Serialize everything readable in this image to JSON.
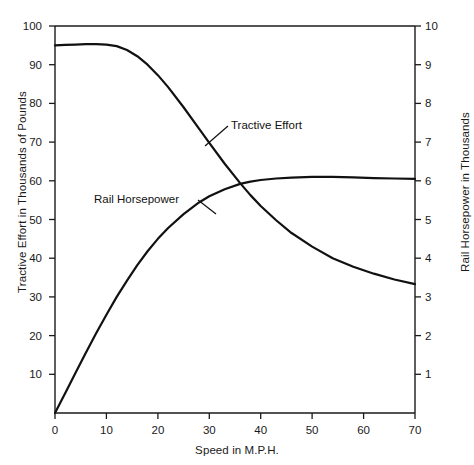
{
  "chart_data": {
    "type": "line",
    "title": "",
    "xlabel": "Speed in M.P.H.",
    "ylabel": "Tractive Effort in Thousands of Pounds",
    "ylabel_right": "Rail Horsepower in Thousands",
    "xlim": [
      0,
      70
    ],
    "ylim": [
      0,
      100
    ],
    "ylim_right": [
      0,
      10
    ],
    "xticks": [
      0,
      10,
      20,
      30,
      40,
      50,
      60,
      70
    ],
    "xtick_labels": [
      "0",
      "10",
      "20",
      "30",
      "40",
      "50",
      "60",
      "70"
    ],
    "yticks": [
      10,
      20,
      30,
      40,
      50,
      60,
      70,
      80,
      90,
      100
    ],
    "ytick_labels": [
      "10",
      "20",
      "30",
      "40",
      "50",
      "60",
      "70",
      "80",
      "90",
      "100"
    ],
    "yticks_right": [
      1,
      2,
      3,
      4,
      5,
      6,
      7,
      8,
      9,
      10
    ],
    "ytick_labels_right": [
      "1",
      "2",
      "3",
      "4",
      "5",
      "6",
      "7",
      "8",
      "9",
      "10"
    ],
    "grid": false,
    "legend_position": "inline-annotations",
    "series": [
      {
        "name": "Tractive Effort",
        "axis": "left",
        "units": "thousands of pounds",
        "x": [
          0,
          2,
          4,
          6,
          8,
          10,
          12,
          14,
          16,
          18,
          20,
          22,
          25,
          28,
          30,
          33,
          36,
          38,
          40,
          43,
          46,
          50,
          54,
          58,
          62,
          66,
          70
        ],
        "values": [
          95,
          95.1,
          95.2,
          95.3,
          95.3,
          95.2,
          94.8,
          93.8,
          92.2,
          90.0,
          87.3,
          84.2,
          79.0,
          73.5,
          69.8,
          64.4,
          59.4,
          56.3,
          53.5,
          49.8,
          46.5,
          43.0,
          40.0,
          37.8,
          36.0,
          34.5,
          33.3
        ]
      },
      {
        "name": "Rail Horsepower",
        "axis": "right",
        "units": "thousands of horsepower",
        "x": [
          0,
          2,
          4,
          6,
          8,
          10,
          12,
          14,
          16,
          18,
          20,
          22,
          25,
          28,
          30,
          33,
          36,
          38,
          40,
          43,
          46,
          50,
          54,
          58,
          62,
          66,
          70
        ],
        "values": [
          0,
          0.52,
          1.04,
          1.56,
          2.06,
          2.54,
          3.0,
          3.42,
          3.82,
          4.18,
          4.5,
          4.78,
          5.14,
          5.44,
          5.6,
          5.78,
          5.92,
          5.98,
          6.02,
          6.06,
          6.08,
          6.1,
          6.1,
          6.09,
          6.07,
          6.06,
          6.05
        ]
      }
    ],
    "annotations": [
      {
        "text": "Tractive Effort",
        "for_series": "Tractive Effort"
      },
      {
        "text": "Rail Horsepower",
        "for_series": "Rail Horsepower"
      }
    ]
  },
  "colors": {
    "background": "#ffffff",
    "axis": "#1a1a1a",
    "curve": "#111111",
    "text": "#1a1a1a"
  }
}
